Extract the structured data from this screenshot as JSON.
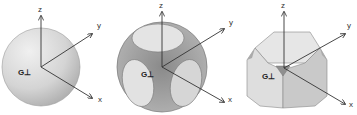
{
  "figures": [
    {
      "name": "sphere",
      "label": "G⊥",
      "axes": {
        "z": "z",
        "y": "y",
        "x": "x"
      }
    },
    {
      "name": "sphere-with-flattened-faces",
      "label": "G⊥",
      "axes": {
        "z": "z",
        "y": "y",
        "x": "x"
      }
    },
    {
      "name": "truncated-cube",
      "label": "G⊥",
      "axes": {
        "z": "z",
        "y": "y",
        "x": "x"
      }
    }
  ],
  "colors": {
    "background": "#ffffff",
    "shape_light": "#e6e6e6",
    "shape_mid": "#c8c8c8",
    "shape_dark": "#9a9a9a",
    "axis": "#333333"
  }
}
